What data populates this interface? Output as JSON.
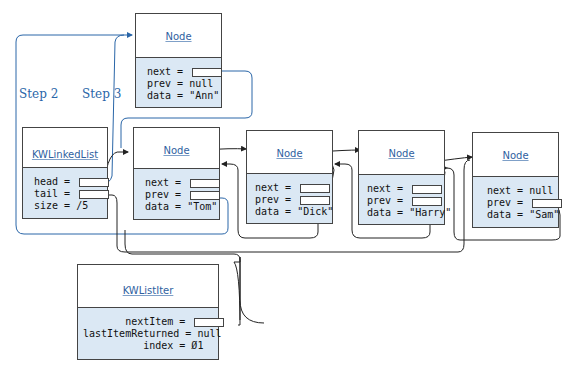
{
  "diagram": {
    "steps": [
      {
        "label": "Step 1"
      },
      {
        "label": "Step 2"
      },
      {
        "label": "Step 3"
      }
    ],
    "new_node": {
      "title": "Node",
      "fields": [
        "next = ",
        "prev = null",
        "data = \"Ann\""
      ]
    },
    "list": {
      "title": "KWLinkedList",
      "fields": [
        "head = ",
        "tail = ",
        "size = /5"
      ]
    },
    "nodes": [
      {
        "title": "Node",
        "fields": [
          "next = ",
          "prev = ",
          "data = \"Tom\""
        ]
      },
      {
        "title": "Node",
        "fields": [
          "next = ",
          "prev = ",
          "data = \"Dick\""
        ]
      },
      {
        "title": "Node",
        "fields": [
          "next = ",
          "prev = ",
          "data = \"Harry\""
        ]
      },
      {
        "title": "Node",
        "fields": [
          "next = null",
          "prev = ",
          "data = \"Sam\""
        ]
      }
    ],
    "iter": {
      "title": "KWListIter",
      "fields": [
        "       nextItem = ",
        "lastItemReturned = null",
        "          index = Ø1"
      ]
    },
    "colors": {
      "highlight_arrow": "#2a66a8",
      "arrow": "#222222",
      "field_bg": "#dbe8f4"
    }
  }
}
